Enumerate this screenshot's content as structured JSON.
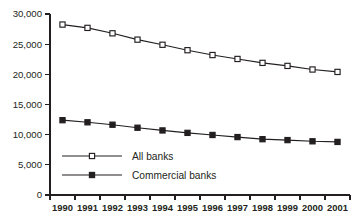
{
  "chart_data": {
    "type": "line",
    "title": "",
    "xlabel": "",
    "ylabel": "",
    "categories": [
      "1990",
      "1991",
      "1992",
      "1993",
      "1994",
      "1995",
      "1996",
      "1997",
      "1998",
      "1999",
      "2000",
      "2001"
    ],
    "series": [
      {
        "name": "All banks",
        "marker": "open-square",
        "values": [
          28250,
          27700,
          26800,
          25750,
          24900,
          24000,
          23200,
          22550,
          21900,
          21400,
          20800,
          20400
        ]
      },
      {
        "name": "Commercial banks",
        "marker": "filled-square",
        "values": [
          12400,
          12050,
          11650,
          11150,
          10700,
          10300,
          9950,
          9600,
          9250,
          9100,
          8900,
          8800
        ]
      }
    ],
    "ylim": [
      0,
      30000
    ],
    "ytick_values": [
      0,
      5000,
      10000,
      15000,
      20000,
      25000,
      30000
    ],
    "ytick_labels": [
      "0",
      "5,000",
      "10,000",
      "15,000",
      "20,000",
      "25,000",
      "30,000"
    ],
    "xtick_labels": [
      "1990",
      "1991",
      "1992",
      "1993",
      "1994",
      "1995",
      "1996",
      "1997",
      "1998",
      "1999",
      "2000",
      "2001"
    ],
    "grid": false,
    "legend_position": "inside-lower-left",
    "legend_entries": [
      "All banks",
      "Commercial banks"
    ],
    "colors": {
      "line": "#231f20",
      "marker_open_fill": "#ffffff",
      "marker_filled_fill": "#231f20",
      "background": "#ffffff"
    }
  }
}
